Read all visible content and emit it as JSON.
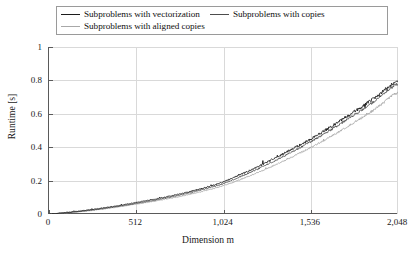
{
  "chart_data": {
    "type": "line",
    "title": "",
    "xlabel": "Dimension m",
    "ylabel": "Runtime [s]",
    "xlim": [
      0,
      2048
    ],
    "ylim": [
      0,
      1
    ],
    "grid": true,
    "legend_position": "top",
    "xticks": [
      0,
      512,
      1024,
      1536,
      2048
    ],
    "xtick_labels": [
      "0",
      "512",
      "1,024",
      "1,536",
      "2,048"
    ],
    "yticks": [
      0,
      0.2,
      0.4,
      0.6,
      0.8,
      1
    ],
    "ytick_labels": [
      "0",
      "0.2",
      "0.4",
      "0.6",
      "0.8",
      "1"
    ],
    "series": [
      {
        "name": "Subproblems with vectorization",
        "color": "#1c1c1c",
        "x": [
          0,
          128,
          256,
          384,
          512,
          640,
          768,
          896,
          1024,
          1152,
          1280,
          1408,
          1536,
          1664,
          1792,
          1920,
          2048
        ],
        "values": [
          0.0,
          0.012,
          0.027,
          0.046,
          0.068,
          0.092,
          0.12,
          0.152,
          0.193,
          0.248,
          0.31,
          0.378,
          0.448,
          0.528,
          0.612,
          0.7,
          0.795
        ],
        "noise": 0.022
      },
      {
        "name": "Subproblems with copies",
        "color": "#4d4d4d",
        "x": [
          0,
          128,
          256,
          384,
          512,
          640,
          768,
          896,
          1024,
          1152,
          1280,
          1408,
          1536,
          1664,
          1792,
          1920,
          2048
        ],
        "values": [
          0.0,
          0.01,
          0.024,
          0.042,
          0.063,
          0.086,
          0.113,
          0.144,
          0.182,
          0.236,
          0.296,
          0.362,
          0.432,
          0.51,
          0.594,
          0.682,
          0.778
        ],
        "noise": 0.018
      },
      {
        "name": "Subproblems with aligned copies",
        "color": "#a8a8a8",
        "x": [
          0,
          128,
          256,
          384,
          512,
          640,
          768,
          896,
          1024,
          1152,
          1280,
          1408,
          1536,
          1664,
          1792,
          1920,
          2048
        ],
        "values": [
          0.0,
          0.009,
          0.022,
          0.039,
          0.059,
          0.08,
          0.105,
          0.134,
          0.17,
          0.218,
          0.272,
          0.332,
          0.398,
          0.47,
          0.548,
          0.632,
          0.726
        ],
        "noise": 0.016
      }
    ]
  },
  "legend": {
    "entries": [
      {
        "label": "Subproblems with vectorization",
        "color": "#1c1c1c"
      },
      {
        "label": "Subproblems with copies",
        "color": "#4d4d4d"
      },
      {
        "label": "Subproblems with aligned copies",
        "color": "#a8a8a8"
      }
    ]
  },
  "axes": {
    "y_title": "Runtime [s]",
    "x_title": "Dimension m",
    "ytick_labels": [
      "1",
      "0.8",
      "0.6",
      "0.4",
      "0.2",
      "0"
    ],
    "xtick_labels": [
      "0",
      "512",
      "1,024",
      "1,536",
      "2,048"
    ]
  },
  "colors": {
    "axis": "#5a5a5a",
    "grid": "#d9d9d9",
    "legend_border": "#9a9a9a",
    "text": "#1a1a1a"
  }
}
